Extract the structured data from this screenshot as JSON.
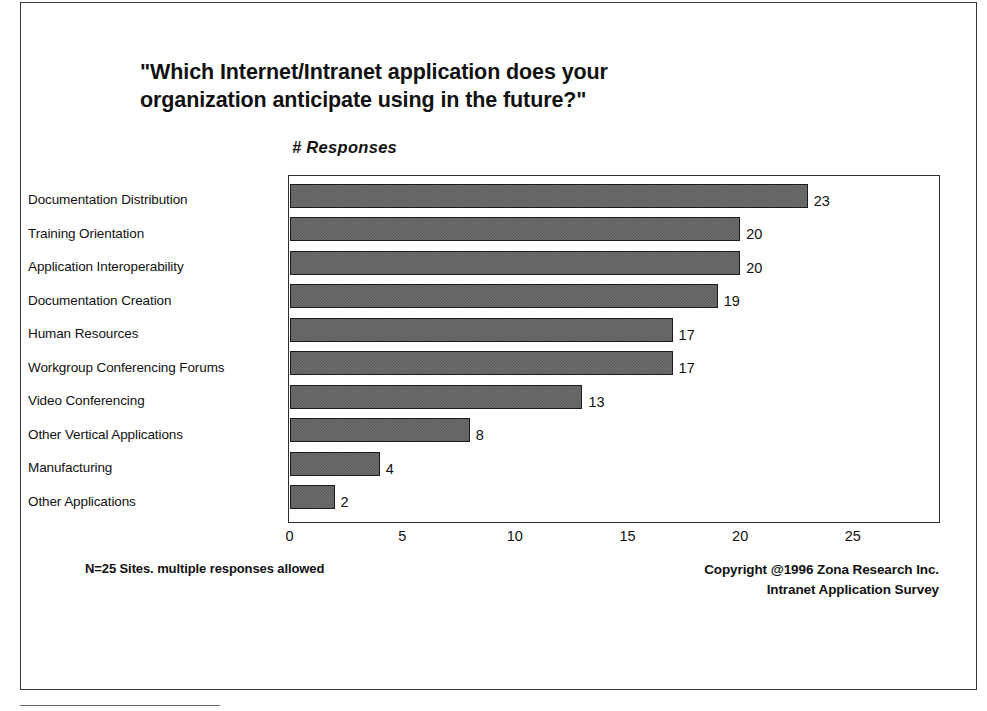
{
  "chart_data": {
    "type": "bar",
    "orientation": "horizontal",
    "title": "\"Which Internet/Intranet application does your organization anticipate using in the future?\"",
    "title_lines": [
      "\"Which Internet/Intranet application does your",
      "organization anticipate using in the future?\""
    ],
    "xlabel": "# Responses",
    "ylabel": "",
    "categories": [
      "Documentation Distribution",
      "Training Orientation",
      "Application Interoperability",
      "Documentation Creation",
      "Human Resources",
      "Workgroup Conferencing Forums",
      "Video Conferencing",
      "Other Vertical Applications",
      "Manufacturing",
      "Other Applications"
    ],
    "values": [
      23,
      20,
      20,
      19,
      17,
      17,
      13,
      8,
      4,
      2
    ],
    "value_labels": [
      "23",
      "20",
      "20",
      "19",
      "17",
      "17",
      "13",
      "8",
      "4",
      "2"
    ],
    "xticks": [
      0,
      5,
      10,
      15,
      20,
      25
    ],
    "xtick_labels": [
      "0",
      "5",
      "10",
      "15",
      "20",
      "25"
    ],
    "xlim": [
      0,
      28.8
    ],
    "grid": false,
    "legend": false,
    "bar_fill_color": "#6e6e6e",
    "bar_edge_color": "#1c1c1c",
    "background_color": "#ffffff",
    "text_color": "#111111"
  },
  "footnotes": {
    "sample_note": "N=25 Sites. multiple responses allowed",
    "copyright_line1": "Copyright @1996 Zona Research Inc.",
    "copyright_line2": "Intranet Application Survey"
  }
}
